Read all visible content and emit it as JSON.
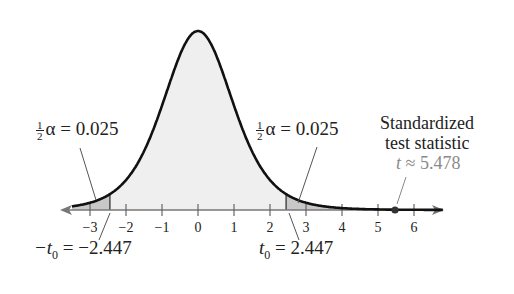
{
  "chart_data": {
    "type": "area",
    "title": "",
    "distribution": "t-distribution (two-tailed rejection regions)",
    "xlabel": "",
    "ylabel": "",
    "xlim": [
      -3.5,
      6.8
    ],
    "ticks": [
      "-3",
      "-2",
      "-1",
      "0",
      "1",
      "2",
      "3",
      "4",
      "5",
      "6"
    ],
    "tick_values": [
      -3,
      -2,
      -1,
      0,
      1,
      2,
      3,
      4,
      5,
      6
    ],
    "critical_values": [
      -2.447,
      2.447
    ],
    "tail_areas": [
      0.025,
      0.025
    ],
    "test_statistic": 5.478,
    "grid": false,
    "annotations": {
      "left_tail": {
        "frac_num": "1",
        "frac_den": "2",
        "text": "α = 0.025"
      },
      "right_tail": {
        "frac_num": "1",
        "frac_den": "2",
        "text": "α = 0.025"
      },
      "left_critical": {
        "prefix": "−t",
        "sub": "0",
        "text": " = −2.447"
      },
      "right_critical": {
        "prefix": "t",
        "sub": "0",
        "text": " = 2.447"
      },
      "statistic_line1": "Standardized",
      "statistic_line2": "test statistic",
      "statistic_value_var": "t",
      "statistic_value": " ≈ 5.478"
    },
    "colors": {
      "curve": "#111111",
      "body_fill": "#efefef",
      "tail_fill": "#c8c8c8",
      "statistic_text": "#8a8a8a"
    }
  }
}
